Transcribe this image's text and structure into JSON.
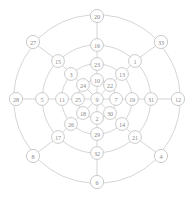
{
  "figure": {
    "name": "radial-node-graph",
    "width": 194,
    "height": 197,
    "background_color": "#ffffff",
    "node_fill_color": "#ffffff",
    "node_stroke_color": "#a8a8a8",
    "edge_color": "#b9b9b9",
    "label_color": "#8a8a8a"
  },
  "chart_data": {
    "type": "diagram",
    "title": "",
    "xlabel": "",
    "ylabel": "",
    "layout": "radial-spoke-ring",
    "center_x": 97,
    "center_y": 99,
    "ring_radii": [
      19,
      35,
      54,
      74,
      90
    ],
    "spoke_count": 8,
    "ring_count": 4,
    "node_count": 33,
    "center_node": {
      "id": "9",
      "label": "9",
      "x": 97,
      "y": 99,
      "ring": 0,
      "spoke": -1
    },
    "nodes": [
      {
        "id": "9",
        "label": "9",
        "x": 97,
        "y": 99,
        "ring": 0,
        "spoke": -1
      },
      {
        "id": "10",
        "label": "10",
        "x": 97,
        "y": 80,
        "ring": 1,
        "spoke": 0
      },
      {
        "id": "22",
        "label": "22",
        "x": 110,
        "y": 85,
        "ring": 1,
        "spoke": 1
      },
      {
        "id": "7",
        "label": "7",
        "x": 116,
        "y": 99,
        "ring": 1,
        "spoke": 2
      },
      {
        "id": "30",
        "label": "30",
        "x": 110,
        "y": 113,
        "ring": 1,
        "spoke": 3
      },
      {
        "id": "2",
        "label": "2",
        "x": 97,
        "y": 118,
        "ring": 1,
        "spoke": 4
      },
      {
        "id": "18",
        "label": "18",
        "x": 83,
        "y": 113,
        "ring": 1,
        "spoke": 5
      },
      {
        "id": "25",
        "label": "25",
        "x": 78,
        "y": 99,
        "ring": 1,
        "spoke": 6
      },
      {
        "id": "24",
        "label": "24",
        "x": 83,
        "y": 85,
        "ring": 1,
        "spoke": 7
      },
      {
        "id": "23",
        "label": "23",
        "x": 97,
        "y": 64,
        "ring": 2,
        "spoke": 0
      },
      {
        "id": "13",
        "label": "13",
        "x": 122,
        "y": 74,
        "ring": 2,
        "spoke": 1
      },
      {
        "id": "19",
        "label": "19",
        "x": 132,
        "y": 99,
        "ring": 2,
        "spoke": 2
      },
      {
        "id": "14",
        "label": "14",
        "x": 122,
        "y": 124,
        "ring": 2,
        "spoke": 3
      },
      {
        "id": "29",
        "label": "29",
        "x": 97,
        "y": 134,
        "ring": 2,
        "spoke": 4
      },
      {
        "id": "26",
        "label": "26",
        "x": 71,
        "y": 124,
        "ring": 2,
        "spoke": 5
      },
      {
        "id": "11",
        "label": "11",
        "x": 62,
        "y": 99,
        "ring": 2,
        "spoke": 6
      },
      {
        "id": "3",
        "label": "3",
        "x": 71,
        "y": 74,
        "ring": 2,
        "spoke": 7
      },
      {
        "id": "16",
        "label": "16",
        "x": 97,
        "y": 45,
        "ring": 3,
        "spoke": 0
      },
      {
        "id": "1",
        "label": "1",
        "x": 135,
        "y": 61,
        "ring": 3,
        "spoke": 1
      },
      {
        "id": "31",
        "label": "31",
        "x": 151,
        "y": 99,
        "ring": 3,
        "spoke": 2
      },
      {
        "id": "21",
        "label": "21",
        "x": 135,
        "y": 137,
        "ring": 3,
        "spoke": 3
      },
      {
        "id": "32",
        "label": "32",
        "x": 97,
        "y": 153,
        "ring": 3,
        "spoke": 4
      },
      {
        "id": "17",
        "label": "17",
        "x": 58,
        "y": 137,
        "ring": 3,
        "spoke": 5
      },
      {
        "id": "5",
        "label": "5",
        "x": 42,
        "y": 99,
        "ring": 3,
        "spoke": 6
      },
      {
        "id": "15",
        "label": "15",
        "x": 58,
        "y": 61,
        "ring": 3,
        "spoke": 7
      },
      {
        "id": "20",
        "label": "20",
        "x": 97,
        "y": 16,
        "ring": 4,
        "spoke": 0
      },
      {
        "id": "33",
        "label": "33",
        "x": 161,
        "y": 42,
        "ring": 4,
        "spoke": 1
      },
      {
        "id": "12",
        "label": "12",
        "x": 178,
        "y": 99,
        "ring": 4,
        "spoke": 2
      },
      {
        "id": "4",
        "label": "4",
        "x": 161,
        "y": 156,
        "ring": 4,
        "spoke": 3
      },
      {
        "id": "6",
        "label": "6",
        "x": 97,
        "y": 182,
        "ring": 4,
        "spoke": 4
      },
      {
        "id": "8",
        "label": "8",
        "x": 33,
        "y": 156,
        "ring": 4,
        "spoke": 5
      },
      {
        "id": "28",
        "label": "28",
        "x": 16,
        "y": 99,
        "ring": 4,
        "spoke": 6
      },
      {
        "id": "27",
        "label": "27",
        "x": 33,
        "y": 42,
        "ring": 4,
        "spoke": 7
      }
    ],
    "spoke_chains": [
      {
        "direction": "north",
        "nodes": [
          "9",
          "10",
          "23",
          "16",
          "20"
        ]
      },
      {
        "direction": "north-east",
        "nodes": [
          "9",
          "22",
          "13",
          "1",
          "33"
        ]
      },
      {
        "direction": "east",
        "nodes": [
          "9",
          "7",
          "19",
          "31",
          "12"
        ]
      },
      {
        "direction": "south-east",
        "nodes": [
          "9",
          "30",
          "14",
          "21",
          "4"
        ]
      },
      {
        "direction": "south",
        "nodes": [
          "9",
          "2",
          "29",
          "32",
          "6"
        ]
      },
      {
        "direction": "south-west",
        "nodes": [
          "9",
          "18",
          "26",
          "17",
          "8"
        ]
      },
      {
        "direction": "west",
        "nodes": [
          "9",
          "25",
          "11",
          "5",
          "28"
        ]
      },
      {
        "direction": "north-west",
        "nodes": [
          "9",
          "24",
          "3",
          "15",
          "27"
        ]
      }
    ],
    "rings": [
      {
        "ring": 1,
        "nodes": [
          "10",
          "22",
          "7",
          "30",
          "2",
          "18",
          "25",
          "24"
        ]
      },
      {
        "ring": 2,
        "nodes": [
          "23",
          "13",
          "19",
          "14",
          "29",
          "26",
          "11",
          "3"
        ]
      },
      {
        "ring": 3,
        "nodes": [
          "16",
          "1",
          "31",
          "21",
          "32",
          "17",
          "5",
          "15"
        ]
      },
      {
        "ring": 4,
        "nodes": [
          "20",
          "33",
          "12",
          "4",
          "6",
          "8",
          "28",
          "27"
        ]
      }
    ]
  }
}
